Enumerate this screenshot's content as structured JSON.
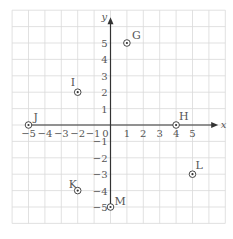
{
  "chart_data": {
    "type": "scatter",
    "title": "",
    "xlabel": "x",
    "ylabel": "y",
    "xlim": [
      -6,
      7
    ],
    "ylim": [
      -6,
      7
    ],
    "grid": true,
    "x_ticks": [
      "-5",
      "-4",
      "-3",
      "-2",
      "-1",
      "0",
      "1",
      "2",
      "3",
      "4",
      "5"
    ],
    "y_ticks": [
      "5",
      "4",
      "3",
      "2",
      "1",
      "-1",
      "-2",
      "-3",
      "-4",
      "-5"
    ],
    "points": [
      {
        "label": "G",
        "x": 1,
        "y": 5
      },
      {
        "label": "I",
        "x": -2,
        "y": 2
      },
      {
        "label": "J",
        "x": -5,
        "y": 0
      },
      {
        "label": "H",
        "x": 4,
        "y": 0
      },
      {
        "label": "K",
        "x": -2,
        "y": -4
      },
      {
        "label": "L",
        "x": 5,
        "y": -3
      },
      {
        "label": "M",
        "x": 0,
        "y": -5
      }
    ]
  },
  "colors": {
    "grid": "#d9d9d9",
    "axis": "#333333",
    "text": "#555555",
    "point": "#333333"
  }
}
